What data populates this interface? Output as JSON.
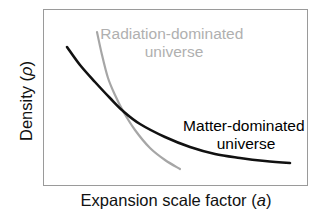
{
  "chart_data": {
    "type": "line",
    "title": "",
    "xlabel": "Expansion scale factor (a)",
    "xlabel_parts": {
      "prefix": "Expansion scale factor (",
      "var": "a",
      "suffix": ")"
    },
    "ylabel": "Density (ρ)",
    "ylabel_parts": {
      "prefix": "Density (",
      "var": "ρ",
      "suffix": ")"
    },
    "axis_ticks": false,
    "grid": false,
    "frame": true,
    "legend": "inline annotations",
    "series": [
      {
        "name": "Radiation-dominated universe",
        "label_lines": [
          "Radiation-dominated",
          "universe"
        ],
        "color": "#a6a6a6",
        "label_color": "#b0b0b0",
        "relation": "ρ ∝ a^-4",
        "points_px": [
          [
            97,
            32
          ],
          [
            102,
            55
          ],
          [
            108,
            78
          ],
          [
            115,
            95
          ],
          [
            123,
            111
          ],
          [
            135,
            130
          ],
          [
            150,
            148
          ],
          [
            165,
            160
          ],
          [
            180,
            169
          ]
        ]
      },
      {
        "name": "Matter-dominated universe",
        "label_lines": [
          "Matter-dominated",
          "universe"
        ],
        "color": "#111111",
        "label_color": "#000000",
        "relation": "ρ ∝ a^-3",
        "points_px": [
          [
            67,
            47
          ],
          [
            80,
            65
          ],
          [
            95,
            82
          ],
          [
            110,
            98
          ],
          [
            123,
            111
          ],
          [
            140,
            124
          ],
          [
            165,
            137
          ],
          [
            190,
            147
          ],
          [
            215,
            154
          ],
          [
            240,
            158
          ],
          [
            265,
            161
          ],
          [
            290,
            163
          ]
        ]
      }
    ],
    "annotations": [
      {
        "text": "Curves intersect at matter–radiation equality",
        "visible": false
      }
    ]
  }
}
